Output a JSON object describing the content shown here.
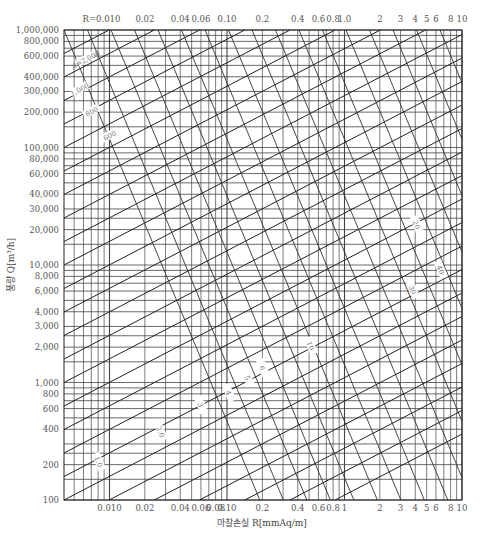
{
  "chart_data": {
    "type": "line",
    "title": "",
    "xlabel": "마찰손실 R[mmAq/m]",
    "ylabel": "풍량 Q[m³/h]",
    "x_scale": "log",
    "y_scale": "log",
    "xlim": [
      0.0041,
      10
    ],
    "ylim": [
      100,
      1000000
    ],
    "grid": true,
    "top_axis_prefix": "R=",
    "x_ticks_top": [
      "0.010",
      "0.02",
      "0.04",
      "0.06",
      "0.10",
      "0.2",
      "0.4",
      "0.6",
      "0.8",
      "1.0",
      "2",
      "3",
      "4",
      "5",
      "6",
      "8",
      "10"
    ],
    "x_ticks_bottom": [
      "0.010",
      "0.02",
      "0.04",
      "0.06",
      "0.08",
      "0.10",
      "0.2",
      "0.4",
      "0.6",
      "0.8",
      "1",
      "2",
      "3",
      "4",
      "5",
      "6",
      "8",
      "10"
    ],
    "x_tick_values": [
      0.01,
      0.02,
      0.04,
      0.06,
      0.08,
      0.1,
      0.2,
      0.4,
      0.6,
      0.8,
      1,
      2,
      3,
      4,
      5,
      6,
      8,
      10
    ],
    "y_ticks": [
      "1,000,000",
      "800,000",
      "600,000",
      "400,000",
      "300,000",
      "200,000",
      "100,000",
      "80,000",
      "60,000",
      "40,000",
      "30,000",
      "20,000",
      "10,000",
      "8,000",
      "6,000",
      "4,000",
      "3,000",
      "2,000",
      "1,000",
      "800",
      "600",
      "400",
      "200",
      "100"
    ],
    "y_tick_values": [
      1000000,
      800000,
      600000,
      400000,
      300000,
      200000,
      100000,
      80000,
      60000,
      40000,
      30000,
      20000,
      10000,
      8000,
      6000,
      4000,
      3000,
      2000,
      1000,
      800,
      600,
      400,
      200,
      100
    ],
    "series": [
      {
        "name": "velocity lines (m/s)",
        "family": "velocity",
        "labels": [
          "1.0",
          "2.0",
          "3",
          "4",
          "5",
          "6",
          "7",
          "8",
          "9",
          "10",
          "15",
          "20",
          "25",
          "30",
          "35",
          "40"
        ]
      },
      {
        "name": "diameter lines (mm)",
        "family": "diameter",
        "labels": [
          "d=2,000",
          "1,800",
          "1,600",
          "1,400",
          "1,200",
          "1,000",
          "800",
          "600",
          "400",
          "300",
          "200",
          "150",
          "100"
        ]
      }
    ],
    "annotations": [
      "1.0",
      "2.0",
      "3",
      "4",
      "5",
      "6",
      "10",
      "20",
      "30",
      "40"
    ],
    "legend": "none"
  }
}
